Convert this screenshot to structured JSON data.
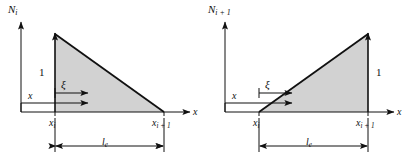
{
  "figure": {
    "type": "diagram",
    "background_color": "#ffffff",
    "line_color": "#111111",
    "fill_color": "#d2d2d2"
  },
  "panels": [
    {
      "id": "left",
      "y_axis_label_base": "N",
      "y_axis_label_sub": "i",
      "x_axis_label": "x",
      "height_label": "1",
      "xi_label": "ξ",
      "x_coord_label": "x",
      "tick_left_base": "x",
      "tick_left_sub": "i",
      "tick_right_base": "x",
      "tick_right_sub": "i + 1",
      "length_label_base": "l",
      "length_label_sub": "e",
      "shape": "decreasing",
      "note": "shape function N_i equals 1 at x_i and 0 at x_i+1"
    },
    {
      "id": "right",
      "y_axis_label_base": "N",
      "y_axis_label_sub": "i + 1",
      "x_axis_label": "x",
      "height_label": "1",
      "xi_label": "ξ",
      "x_coord_label": "x",
      "tick_left_base": "x",
      "tick_left_sub": "i",
      "tick_right_base": "x",
      "tick_right_sub": "i + 1",
      "length_label_base": "l",
      "length_label_sub": "e",
      "shape": "increasing",
      "note": "shape function N_i+1 equals 0 at x_i and 1 at x_i+1"
    }
  ]
}
